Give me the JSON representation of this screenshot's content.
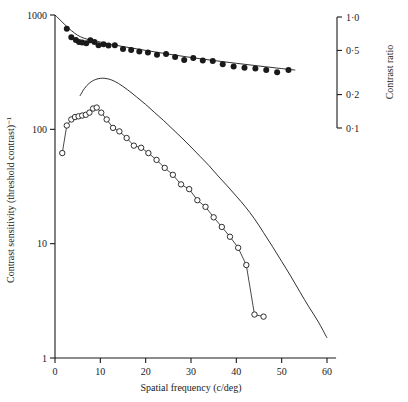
{
  "figure": {
    "background": "#ffffff",
    "ink": "#1a1a1a"
  },
  "chart_data": {
    "type": "scatter",
    "title": "",
    "xlabel": "Spatial frequency  (c/deg)",
    "ylabel": "Contrast sensitivity (threshold contrast)⁻¹",
    "y2label": "Contrast ratio",
    "xscale": "linear",
    "yscale": "log",
    "y2scale": "log",
    "xlim": [
      0,
      62
    ],
    "ylim": [
      1,
      1000
    ],
    "y2lim": [
      0.1,
      1.0
    ],
    "grid": false,
    "legend": "none",
    "xticks": [
      0,
      10,
      20,
      30,
      40,
      50,
      60
    ],
    "xticklabels": [
      "0",
      "10",
      "20",
      "30",
      "40",
      "50",
      "60"
    ],
    "yticks": [
      1,
      10,
      100,
      1000
    ],
    "yticklabels": [
      "1",
      "10",
      "100",
      "1000"
    ],
    "y2ticks": [
      1.0,
      0.5,
      0.2,
      0.1
    ],
    "y2ticklabels": [
      "1·0",
      "0·5",
      "0·2",
      "0·1"
    ],
    "series": [
      {
        "name": "filled-circles",
        "marker": "filled-circle",
        "connected": false,
        "points": [
          [
            2.6,
            760
          ],
          [
            3.6,
            640
          ],
          [
            4.6,
            605
          ],
          [
            5.3,
            580
          ],
          [
            6.0,
            575
          ],
          [
            6.9,
            565
          ],
          [
            7.8,
            600
          ],
          [
            8.7,
            580
          ],
          [
            9.6,
            545
          ],
          [
            10.7,
            555
          ],
          [
            11.8,
            540
          ],
          [
            13.2,
            545
          ],
          [
            15.0,
            505
          ],
          [
            16.8,
            495
          ],
          [
            18.6,
            480
          ],
          [
            20.5,
            470
          ],
          [
            22.5,
            450
          ],
          [
            24.5,
            455
          ],
          [
            26.5,
            430
          ],
          [
            28.5,
            405
          ],
          [
            30.5,
            420
          ],
          [
            32.6,
            400
          ],
          [
            34.8,
            395
          ],
          [
            37.0,
            370
          ],
          [
            39.4,
            355
          ],
          [
            41.8,
            345
          ],
          [
            44.2,
            340
          ],
          [
            46.6,
            330
          ],
          [
            49.0,
            315
          ],
          [
            51.5,
            330
          ]
        ]
      },
      {
        "name": "fitted-line-upper",
        "marker": "none",
        "connected": true,
        "points": [
          [
            0,
            1000
          ],
          [
            5,
            665
          ],
          [
            10,
            580
          ],
          [
            15,
            530
          ],
          [
            20,
            490
          ],
          [
            25,
            455
          ],
          [
            30,
            425
          ],
          [
            35,
            400
          ],
          [
            40,
            378
          ],
          [
            45,
            358
          ],
          [
            50,
            340
          ],
          [
            53,
            330
          ]
        ]
      },
      {
        "name": "open-circles",
        "marker": "open-circle",
        "connected": true,
        "points": [
          [
            1.6,
            62
          ],
          [
            2.6,
            108
          ],
          [
            3.6,
            122
          ],
          [
            4.4,
            128
          ],
          [
            5.2,
            130
          ],
          [
            6.0,
            132
          ],
          [
            6.8,
            134
          ],
          [
            7.6,
            140
          ],
          [
            8.4,
            152
          ],
          [
            9.2,
            155
          ],
          [
            10.2,
            140
          ],
          [
            11.4,
            122
          ],
          [
            12.8,
            103
          ],
          [
            14.2,
            96
          ],
          [
            15.8,
            84
          ],
          [
            17.4,
            72
          ],
          [
            19.0,
            69
          ],
          [
            20.6,
            62
          ],
          [
            22.4,
            54
          ],
          [
            24.2,
            46
          ],
          [
            26.0,
            40
          ],
          [
            27.8,
            33
          ],
          [
            29.6,
            30
          ],
          [
            31.4,
            24
          ],
          [
            33.2,
            21
          ],
          [
            35.0,
            17
          ],
          [
            36.8,
            14
          ],
          [
            38.6,
            11.5
          ],
          [
            40.4,
            9.2
          ],
          [
            42.2,
            6.5
          ],
          [
            44.0,
            2.4
          ],
          [
            46.0,
            2.3
          ]
        ]
      },
      {
        "name": "smooth-curve-lower",
        "marker": "none",
        "connected": true,
        "points": [
          [
            5.5,
            196
          ],
          [
            6.5,
            228
          ],
          [
            7.5,
            252
          ],
          [
            8.5,
            268
          ],
          [
            9.5,
            277
          ],
          [
            10.5,
            280
          ],
          [
            11.5,
            277
          ],
          [
            12.5,
            270
          ],
          [
            14.0,
            252
          ],
          [
            16.0,
            222
          ],
          [
            18.0,
            192
          ],
          [
            20.0,
            165
          ],
          [
            22.0,
            140
          ],
          [
            24.0,
            119
          ],
          [
            26.0,
            100
          ],
          [
            28.0,
            84
          ],
          [
            30.0,
            70
          ],
          [
            32.0,
            58
          ],
          [
            34.0,
            48
          ],
          [
            36.0,
            39
          ],
          [
            38.0,
            32
          ],
          [
            40.0,
            26
          ],
          [
            42.0,
            21
          ],
          [
            44.0,
            16.5
          ],
          [
            46.0,
            12.5
          ],
          [
            48.0,
            9.4
          ],
          [
            50.0,
            7.0
          ],
          [
            52.0,
            5.2
          ],
          [
            54.0,
            3.8
          ],
          [
            56.0,
            2.8
          ],
          [
            58.0,
            2.1
          ],
          [
            60.0,
            1.5
          ]
        ]
      }
    ]
  }
}
